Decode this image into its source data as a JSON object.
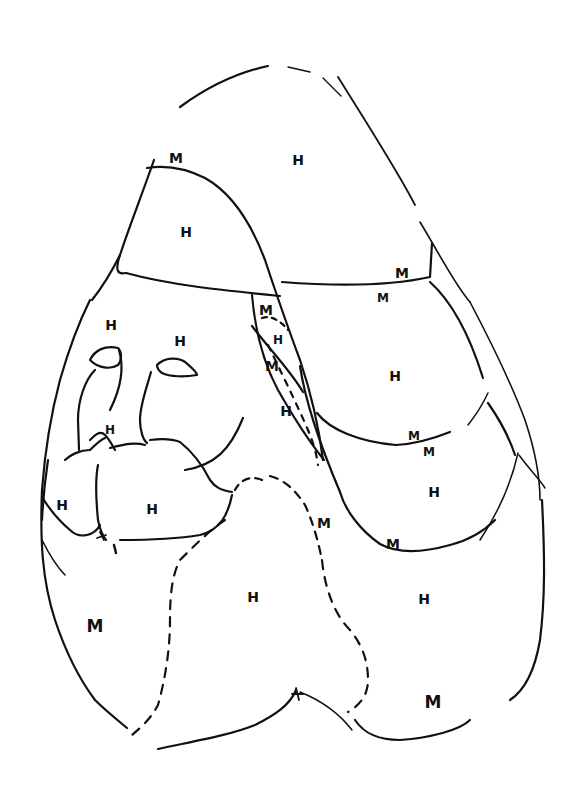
{
  "figure": {
    "stroke_color": "#111111",
    "background_color": "#ffffff"
  },
  "labels": [
    {
      "text": "M",
      "x": 176,
      "y": 158,
      "size": "md"
    },
    {
      "text": "H",
      "x": 298,
      "y": 160,
      "size": "md"
    },
    {
      "text": "H",
      "x": 186,
      "y": 232,
      "size": "md"
    },
    {
      "text": "M",
      "x": 402,
      "y": 273,
      "size": "md"
    },
    {
      "text": "M",
      "x": 383,
      "y": 298,
      "size": "sm"
    },
    {
      "text": "H",
      "x": 111,
      "y": 325,
      "size": "md"
    },
    {
      "text": "M",
      "x": 266,
      "y": 310,
      "size": "md"
    },
    {
      "text": "H",
      "x": 180,
      "y": 341,
      "size": "md"
    },
    {
      "text": "H",
      "x": 278,
      "y": 340,
      "size": "sm"
    },
    {
      "text": "M",
      "x": 272,
      "y": 366,
      "size": "md"
    },
    {
      "text": "H",
      "x": 395,
      "y": 376,
      "size": "md"
    },
    {
      "text": "H",
      "x": 286,
      "y": 411,
      "size": "md"
    },
    {
      "text": "H",
      "x": 110,
      "y": 430,
      "size": "sm"
    },
    {
      "text": "M",
      "x": 414,
      "y": 436,
      "size": "sm"
    },
    {
      "text": "M",
      "x": 429,
      "y": 452,
      "size": "sm"
    },
    {
      "text": "H",
      "x": 434,
      "y": 492,
      "size": "md"
    },
    {
      "text": "H",
      "x": 62,
      "y": 505,
      "size": "md"
    },
    {
      "text": "H",
      "x": 152,
      "y": 509,
      "size": "md"
    },
    {
      "text": "M",
      "x": 324,
      "y": 523,
      "size": "md"
    },
    {
      "text": "M",
      "x": 393,
      "y": 544,
      "size": "md"
    },
    {
      "text": "H",
      "x": 253,
      "y": 597,
      "size": "md"
    },
    {
      "text": "H",
      "x": 424,
      "y": 599,
      "size": "md"
    },
    {
      "text": "M",
      "x": 95,
      "y": 626,
      "size": "lg"
    },
    {
      "text": "M",
      "x": 433,
      "y": 702,
      "size": "lg"
    }
  ]
}
